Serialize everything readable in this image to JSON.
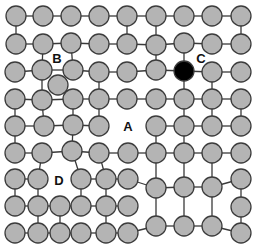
{
  "diagram": {
    "title": "",
    "node_radius": 10,
    "colors": {
      "node_fill": "#b4b4b4",
      "node_highlight_fill": "#000000",
      "edge": "#3a3a3a",
      "background": "#ffffff",
      "label": "#111111"
    },
    "labels": [
      {
        "id": "B",
        "text": "B",
        "x": 57,
        "y": 63
      },
      {
        "id": "C",
        "text": "C",
        "x": 201,
        "y": 63
      },
      {
        "id": "A",
        "text": "A",
        "x": 128,
        "y": 131
      },
      {
        "id": "D",
        "text": "D",
        "x": 59,
        "y": 185
      }
    ],
    "nodes": [
      {
        "id": "r1c1",
        "x": 16,
        "y": 16
      },
      {
        "id": "r1c2",
        "x": 43,
        "y": 16
      },
      {
        "id": "r1c3",
        "x": 71,
        "y": 16
      },
      {
        "id": "r1c4",
        "x": 99,
        "y": 16
      },
      {
        "id": "r1c5",
        "x": 127,
        "y": 16
      },
      {
        "id": "r1c6",
        "x": 156,
        "y": 16
      },
      {
        "id": "r1c7",
        "x": 184,
        "y": 16
      },
      {
        "id": "r1c8",
        "x": 212,
        "y": 16
      },
      {
        "id": "r1c9",
        "x": 241,
        "y": 16
      },
      {
        "id": "r2c1",
        "x": 16,
        "y": 44
      },
      {
        "id": "r2c2",
        "x": 43,
        "y": 44
      },
      {
        "id": "r2c3",
        "x": 71,
        "y": 43
      },
      {
        "id": "r2c4",
        "x": 99,
        "y": 44
      },
      {
        "id": "r2c5",
        "x": 127,
        "y": 44
      },
      {
        "id": "r2c6",
        "x": 156,
        "y": 45
      },
      {
        "id": "r2c7",
        "x": 184,
        "y": 43
      },
      {
        "id": "r2c8",
        "x": 212,
        "y": 44
      },
      {
        "id": "r2c9",
        "x": 241,
        "y": 44
      },
      {
        "id": "r3c1",
        "x": 15,
        "y": 72
      },
      {
        "id": "r3c2",
        "x": 42,
        "y": 70
      },
      {
        "id": "r3c3",
        "x": 73,
        "y": 70
      },
      {
        "id": "r3c4",
        "x": 99,
        "y": 72
      },
      {
        "id": "r3c5",
        "x": 127,
        "y": 72
      },
      {
        "id": "r3c6",
        "x": 156,
        "y": 70
      },
      {
        "id": "r3c7",
        "x": 184,
        "y": 71,
        "highlight": true
      },
      {
        "id": "r3c8",
        "x": 212,
        "y": 72
      },
      {
        "id": "r3c9",
        "x": 241,
        "y": 72
      },
      {
        "id": "b_iso",
        "x": 58,
        "y": 85
      },
      {
        "id": "r4c1",
        "x": 15,
        "y": 99
      },
      {
        "id": "r4c2",
        "x": 42,
        "y": 100
      },
      {
        "id": "r4c3",
        "x": 73,
        "y": 99
      },
      {
        "id": "r4c4",
        "x": 99,
        "y": 99
      },
      {
        "id": "r4c5",
        "x": 127,
        "y": 99
      },
      {
        "id": "r4c6",
        "x": 156,
        "y": 99
      },
      {
        "id": "r4c7",
        "x": 184,
        "y": 99
      },
      {
        "id": "r4c8",
        "x": 212,
        "y": 99
      },
      {
        "id": "r4c9",
        "x": 241,
        "y": 99
      },
      {
        "id": "r5c1",
        "x": 15,
        "y": 126
      },
      {
        "id": "r5c2",
        "x": 44,
        "y": 126
      },
      {
        "id": "r5c3",
        "x": 73,
        "y": 125
      },
      {
        "id": "r5c4",
        "x": 99,
        "y": 126
      },
      {
        "id": "r5c6",
        "x": 156,
        "y": 126
      },
      {
        "id": "r5c7",
        "x": 184,
        "y": 126
      },
      {
        "id": "r5c8",
        "x": 212,
        "y": 126
      },
      {
        "id": "r5c9",
        "x": 241,
        "y": 126
      },
      {
        "id": "r6c1",
        "x": 15,
        "y": 153
      },
      {
        "id": "r6c2",
        "x": 42,
        "y": 153
      },
      {
        "id": "r6c3",
        "x": 72,
        "y": 151
      },
      {
        "id": "r6c4",
        "x": 99,
        "y": 153
      },
      {
        "id": "r6c5",
        "x": 128,
        "y": 153
      },
      {
        "id": "r6c6",
        "x": 156,
        "y": 153
      },
      {
        "id": "r6c7",
        "x": 184,
        "y": 153
      },
      {
        "id": "r6c8",
        "x": 212,
        "y": 153
      },
      {
        "id": "r6c9",
        "x": 241,
        "y": 153
      },
      {
        "id": "r7c1",
        "x": 15,
        "y": 179
      },
      {
        "id": "r7c2",
        "x": 38,
        "y": 179
      },
      {
        "id": "r7c3",
        "x": 81,
        "y": 179
      },
      {
        "id": "r7c4",
        "x": 106,
        "y": 179
      },
      {
        "id": "r7c5",
        "x": 128,
        "y": 179
      },
      {
        "id": "r7c6",
        "x": 156,
        "y": 188
      },
      {
        "id": "r7c7",
        "x": 184,
        "y": 187
      },
      {
        "id": "r7c8",
        "x": 212,
        "y": 187
      },
      {
        "id": "r7c9",
        "x": 241,
        "y": 179
      },
      {
        "id": "r8c1",
        "x": 15,
        "y": 206
      },
      {
        "id": "r8c2",
        "x": 38,
        "y": 206
      },
      {
        "id": "r8c3",
        "x": 60,
        "y": 206
      },
      {
        "id": "r8c4",
        "x": 81,
        "y": 206
      },
      {
        "id": "r8c5",
        "x": 106,
        "y": 206
      },
      {
        "id": "r8c6",
        "x": 128,
        "y": 206
      },
      {
        "id": "r8c9",
        "x": 241,
        "y": 207
      },
      {
        "id": "r9c1",
        "x": 15,
        "y": 233
      },
      {
        "id": "r9c2",
        "x": 38,
        "y": 233
      },
      {
        "id": "r9c3",
        "x": 60,
        "y": 233
      },
      {
        "id": "r9c4",
        "x": 81,
        "y": 233
      },
      {
        "id": "r9c5",
        "x": 106,
        "y": 233
      },
      {
        "id": "r9c6",
        "x": 128,
        "y": 233
      },
      {
        "id": "r9c7",
        "x": 156,
        "y": 226
      },
      {
        "id": "r9c8",
        "x": 184,
        "y": 226
      },
      {
        "id": "r9c9",
        "x": 212,
        "y": 226
      },
      {
        "id": "r9c10",
        "x": 241,
        "y": 233
      }
    ],
    "edges": [
      [
        "r1c1",
        "r1c2"
      ],
      [
        "r1c2",
        "r1c3"
      ],
      [
        "r1c3",
        "r1c4"
      ],
      [
        "r1c4",
        "r1c5"
      ],
      [
        "r1c5",
        "r1c6"
      ],
      [
        "r1c6",
        "r1c7"
      ],
      [
        "r1c7",
        "r1c8"
      ],
      [
        "r1c8",
        "r1c9"
      ],
      [
        "r1c1",
        "r2c1"
      ],
      [
        "r1c5",
        "r2c5"
      ],
      [
        "r1c6",
        "r2c6"
      ],
      [
        "r1c9",
        "r2c9"
      ],
      [
        "r2c1",
        "r2c2"
      ],
      [
        "r2c2",
        "r2c3"
      ],
      [
        "r2c3",
        "r2c4"
      ],
      [
        "r2c4",
        "r2c5"
      ],
      [
        "r2c5",
        "r2c6"
      ],
      [
        "r2c6",
        "r2c7"
      ],
      [
        "r2c7",
        "r2c8"
      ],
      [
        "r2c8",
        "r2c9"
      ],
      [
        "r2c2",
        "r3c2"
      ],
      [
        "r2c3",
        "r3c3"
      ],
      [
        "r2c6",
        "r3c6"
      ],
      [
        "r2c7",
        "r3c7"
      ],
      [
        "r3c1",
        "r3c2"
      ],
      [
        "r3c2",
        "r3c3"
      ],
      [
        "r3c3",
        "r3c4"
      ],
      [
        "r3c4",
        "r3c5"
      ],
      [
        "r3c5",
        "r3c6"
      ],
      [
        "r3c6",
        "r3c7"
      ],
      [
        "r3c7",
        "r3c8"
      ],
      [
        "r3c8",
        "r3c9"
      ],
      [
        "r3c2",
        "r4c2"
      ],
      [
        "r3c4",
        "r4c4"
      ],
      [
        "r3c7",
        "r4c7"
      ],
      [
        "r3c8",
        "r4c8"
      ],
      [
        "r4c1",
        "r4c2"
      ],
      [
        "r4c2",
        "r4c3"
      ],
      [
        "r4c3",
        "r4c4"
      ],
      [
        "r4c4",
        "r4c5"
      ],
      [
        "r4c5",
        "r4c6"
      ],
      [
        "r4c6",
        "r4c7"
      ],
      [
        "r4c7",
        "r4c8"
      ],
      [
        "r4c8",
        "r4c9"
      ],
      [
        "r4c1",
        "r5c1"
      ],
      [
        "r4c2",
        "r5c2"
      ],
      [
        "r4c3",
        "r5c3"
      ],
      [
        "r4c4",
        "r5c4"
      ],
      [
        "r4c7",
        "r5c7"
      ],
      [
        "r4c8",
        "r5c8"
      ],
      [
        "r4c9",
        "r5c9"
      ],
      [
        "r5c1",
        "r5c2"
      ],
      [
        "r5c2",
        "r5c3"
      ],
      [
        "r5c3",
        "r5c4"
      ],
      [
        "r5c6",
        "r5c7"
      ],
      [
        "r5c7",
        "r5c8"
      ],
      [
        "r5c8",
        "r5c9"
      ],
      [
        "r5c1",
        "r6c1"
      ],
      [
        "r5c3",
        "r6c3"
      ],
      [
        "r5c6",
        "r6c6"
      ],
      [
        "r5c7",
        "r6c7"
      ],
      [
        "r6c1",
        "r6c2"
      ],
      [
        "r6c2",
        "r6c3"
      ],
      [
        "r6c3",
        "r6c4"
      ],
      [
        "r6c4",
        "r6c5"
      ],
      [
        "r6c5",
        "r6c6"
      ],
      [
        "r6c6",
        "r6c7"
      ],
      [
        "r6c7",
        "r6c8"
      ],
      [
        "r6c8",
        "r6c9"
      ],
      [
        "r6c2",
        "r7c2"
      ],
      [
        "r6c3",
        "r7c3"
      ],
      [
        "r6c4",
        "r7c4"
      ],
      [
        "r6c6",
        "r7c6"
      ],
      [
        "r6c7",
        "r7c7"
      ],
      [
        "r6c8",
        "r7c8"
      ],
      [
        "r7c1",
        "r7c2"
      ],
      [
        "r7c3",
        "r7c4"
      ],
      [
        "r7c4",
        "r7c5"
      ],
      [
        "r7c5",
        "r7c6"
      ],
      [
        "r7c6",
        "r7c7"
      ],
      [
        "r7c7",
        "r7c8"
      ],
      [
        "r7c8",
        "r7c9"
      ],
      [
        "r7c1",
        "r8c1"
      ],
      [
        "r7c2",
        "r8c2"
      ],
      [
        "r7c3",
        "r8c4"
      ],
      [
        "r7c4",
        "r8c5"
      ],
      [
        "r7c6",
        "r9c7"
      ],
      [
        "r7c7",
        "r9c8"
      ],
      [
        "r7c8",
        "r9c9"
      ],
      [
        "r7c9",
        "r8c9"
      ],
      [
        "r8c1",
        "r8c2"
      ],
      [
        "r8c2",
        "r8c3"
      ],
      [
        "r8c3",
        "r8c4"
      ],
      [
        "r8c4",
        "r8c5"
      ],
      [
        "r8c5",
        "r8c6"
      ],
      [
        "r8c2",
        "r9c2"
      ],
      [
        "r8c3",
        "r9c3"
      ],
      [
        "r8c5",
        "r9c5"
      ],
      [
        "r8c9",
        "r9c10"
      ],
      [
        "r9c1",
        "r9c2"
      ],
      [
        "r9c2",
        "r9c3"
      ],
      [
        "r9c3",
        "r9c4"
      ],
      [
        "r9c4",
        "r9c5"
      ],
      [
        "r9c5",
        "r9c6"
      ],
      [
        "r9c6",
        "r9c7"
      ],
      [
        "r9c7",
        "r9c8"
      ],
      [
        "r9c8",
        "r9c9"
      ],
      [
        "r9c9",
        "r9c10"
      ]
    ]
  }
}
